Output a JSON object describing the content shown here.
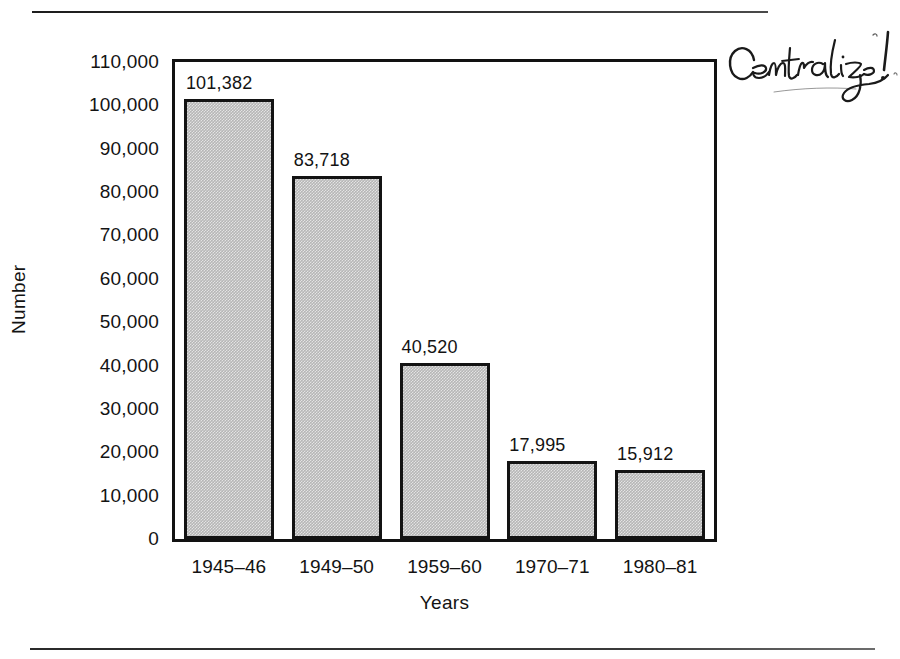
{
  "page": {
    "rule_top": "horizontal-rule",
    "rule_bottom": "horizontal-rule"
  },
  "annotation": {
    "text": "Centralize!",
    "style": "handwritten-cursive-ink",
    "color": "#1a1a1a"
  },
  "chart_data": {
    "type": "bar",
    "title": "",
    "subtitle": "",
    "xlabel": "Years",
    "ylabel": "Number",
    "categories": [
      "1945–46",
      "1949–50",
      "1959–60",
      "1970–71",
      "1980–81"
    ],
    "values": [
      101382,
      83718,
      40520,
      17995,
      15912
    ],
    "value_labels": [
      "101,382",
      "83,718",
      "40,520",
      "17,995",
      "15,912"
    ],
    "ylim": [
      0,
      110000
    ],
    "ytick_step": 10000,
    "ytick_labels": [
      "110,000",
      "100,000",
      "90,000",
      "80,000",
      "70,000",
      "60,000",
      "50,000",
      "40,000",
      "30,000",
      "20,000",
      "10,000",
      "0"
    ],
    "ytick_values": [
      110000,
      100000,
      90000,
      80000,
      70000,
      60000,
      50000,
      40000,
      30000,
      20000,
      10000,
      0
    ],
    "grid": false,
    "legend": "none",
    "bar_fill_color": "#b6b6b6",
    "bar_edge_color": "#131313",
    "axis_color": "#121212",
    "text_color": "#131313",
    "background": "#ffffff"
  }
}
